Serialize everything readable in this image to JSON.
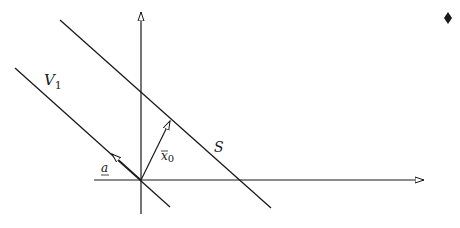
{
  "diagram": {
    "type": "geometric-vector-diagram",
    "labels": {
      "line_v1": "V",
      "line_v1_sub": "1",
      "line_s": "S",
      "vector_x0": "x",
      "vector_x0_sub": "0",
      "vector_a": "a"
    },
    "colors": {
      "stroke": "#1a1a1a",
      "background": "#ffffff"
    },
    "elements": [
      {
        "name": "horizontal-axis",
        "from": [
          94,
          180
        ],
        "to": [
          424,
          180
        ],
        "arrow": "end"
      },
      {
        "name": "vertical-axis",
        "from": [
          141,
          214
        ],
        "to": [
          141,
          12
        ],
        "arrow": "end"
      },
      {
        "name": "line-v1",
        "from": [
          15,
          68
        ],
        "to": [
          170,
          207
        ],
        "passes_through_origin": true
      },
      {
        "name": "line-s",
        "from": [
          60,
          20
        ],
        "to": [
          271,
          208
        ],
        "parallel_to": "line-v1"
      },
      {
        "name": "vector-x0",
        "from": [
          141,
          180
        ],
        "to": [
          170,
          121
        ],
        "arrow": "end"
      },
      {
        "name": "vector-a",
        "from": [
          141,
          180
        ],
        "to": [
          112,
          154
        ],
        "arrow": "end"
      },
      {
        "name": "bullet-marker",
        "at": [
          448,
          18
        ],
        "shape": "diamond"
      }
    ]
  }
}
